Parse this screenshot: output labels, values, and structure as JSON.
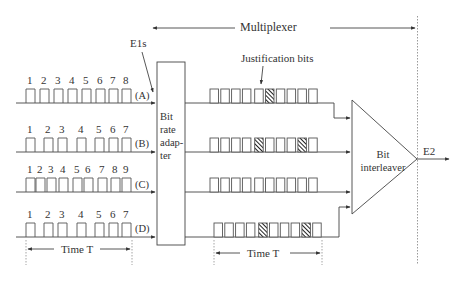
{
  "diagram": {
    "title": "Multiplexer",
    "input_label": "E1s",
    "output_label": "E2",
    "justification_label": "Justification bits",
    "adapter": {
      "lines": [
        "Bit",
        "rate",
        "adap-",
        "ter"
      ]
    },
    "interleaver": {
      "lines": [
        "Bit",
        "interleaver"
      ]
    },
    "time_left": "Time T",
    "time_right": "Time T",
    "colors": {
      "line": "#4a4a4a",
      "text": "#333333",
      "dotted": "#9a9a9a",
      "hatch": "#222222"
    }
  },
  "channels": [
    {
      "id": "A",
      "label": "(A)",
      "bits": [
        "1",
        "2",
        "3",
        "4",
        "5",
        "6",
        "7",
        "8"
      ],
      "justified_positions": [
        5
      ]
    },
    {
      "id": "B",
      "label": "(B)",
      "bits": [
        "1",
        "2",
        "3",
        "4",
        "5",
        "6",
        "7"
      ],
      "justified_positions": [
        4,
        8
      ]
    },
    {
      "id": "C",
      "label": "(C)",
      "bits": [
        "1",
        "2",
        "3",
        "4",
        "5",
        "6",
        "7",
        "8",
        "9"
      ],
      "justified_positions": []
    },
    {
      "id": "D",
      "label": "(D)",
      "bits": [
        "1",
        "2",
        "3",
        "4",
        "5",
        "6",
        "7"
      ],
      "justified_positions": [
        4,
        8
      ]
    }
  ]
}
